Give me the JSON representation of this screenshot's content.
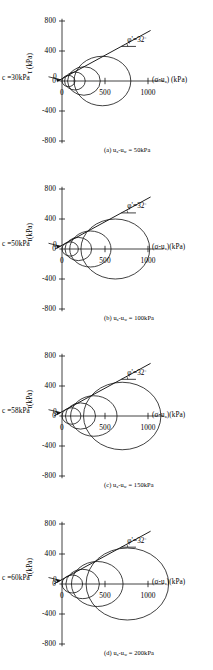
{
  "figure": {
    "type": "multi-panel-mohr-circle-figure",
    "panel_count": 4,
    "axis": {
      "y_label": "τ (kPa)",
      "y_label_b": "τ(kPa)",
      "y_ticks": [
        "800",
        "400",
        "0",
        "-400",
        "-800"
      ],
      "y_tick_values": [
        800,
        400,
        0,
        -400,
        -800
      ],
      "x_ticks": [
        "0",
        "500",
        "1000"
      ],
      "x_tick_values": [
        0,
        500,
        1000
      ],
      "x_label_spaced": "(σ-u",
      "x_label_sub": "a",
      "x_label_tail_spaced": ") (kPa)",
      "x_label_tail_tight": ")(kPa)",
      "origin_zero": "0"
    },
    "envelope": {
      "phi_symbol": "φ'=32",
      "phi_degree": "°",
      "phi_value": 32,
      "phi_label_full": "φ'=32°"
    }
  },
  "chart_data": {
    "type": "scatter",
    "xlabel": "(σ-u_a) (kPa)",
    "ylabel": "τ (kPa)",
    "xlim": [
      -60,
      1200
    ],
    "ylim": [
      -900,
      900
    ],
    "grid": false,
    "legend": "none",
    "shared": {
      "phi_deg": 32,
      "x_ticks": [
        0,
        500,
        1000
      ],
      "y_ticks": [
        800,
        400,
        0,
        -400,
        -800
      ]
    },
    "panels": [
      {
        "id": "a",
        "label": "(a) u",
        "label_sub1": "a",
        "label_mid": "-u",
        "label_sub2": "w",
        "label_tail": " = 50kPa",
        "caption": "(a) u_a-u_w = 50kPa",
        "matric_suction_kPa": 50,
        "cohesion_label_pre": "c =30kPa",
        "cohesion_kPa": 30,
        "phi_label": "φ'=32°",
        "envelope_intercept_kPa": 30,
        "envelope_slope_deg": 32,
        "circles": [
          {
            "center_kPa": 75,
            "radius_kPa": 75
          },
          {
            "center_kPa": 150,
            "radius_kPa": 120
          },
          {
            "center_kPa": 255,
            "radius_kPa": 190
          },
          {
            "center_kPa": 470,
            "radius_kPa": 330
          }
        ]
      },
      {
        "id": "b",
        "label": "(b) u",
        "label_sub1": "a",
        "label_mid": "-u",
        "label_sub2": "w",
        "label_tail": " = 100kPa",
        "caption": "(b) u_a-u_w = 100kPa",
        "matric_suction_kPa": 100,
        "cohesion_label_pre": "c =50kPa",
        "cohesion_kPa": 50,
        "phi_label": "φ'=32°",
        "envelope_intercept_kPa": 50,
        "envelope_slope_deg": 32,
        "circles": [
          {
            "center_kPa": 95,
            "radius_kPa": 95
          },
          {
            "center_kPa": 190,
            "radius_kPa": 155
          },
          {
            "center_kPa": 330,
            "radius_kPa": 240
          },
          {
            "center_kPa": 620,
            "radius_kPa": 400
          }
        ]
      },
      {
        "id": "c",
        "label": "(c) u",
        "label_sub1": "a",
        "label_mid": "-u",
        "label_sub2": "w",
        "label_tail": " = 150kPa",
        "caption": "(c) u_a-u_w = 150kPa",
        "matric_suction_kPa": 150,
        "cohesion_label_pre": "c =58kPa",
        "cohesion_kPa": 58,
        "phi_label": "φ'=32°",
        "envelope_intercept_kPa": 58,
        "envelope_slope_deg": 32,
        "circles": [
          {
            "center_kPa": 110,
            "radius_kPa": 110
          },
          {
            "center_kPa": 215,
            "radius_kPa": 175
          },
          {
            "center_kPa": 370,
            "radius_kPa": 270
          },
          {
            "center_kPa": 700,
            "radius_kPa": 450
          }
        ]
      },
      {
        "id": "d",
        "label": "(d) u",
        "label_sub1": "a",
        "label_mid": "-u",
        "label_sub2": "w",
        "label_tail": " = 200kPa",
        "caption": "(d) u_a-u_w = 200kPa",
        "matric_suction_kPa": 200,
        "cohesion_label_pre": "c =60kPa",
        "cohesion_kPa": 60,
        "phi_label": "φ'=32°",
        "envelope_intercept_kPa": 60,
        "envelope_slope_deg": 32,
        "circles": [
          {
            "center_kPa": 120,
            "radius_kPa": 120
          },
          {
            "center_kPa": 240,
            "radius_kPa": 195
          },
          {
            "center_kPa": 410,
            "radius_kPa": 300
          },
          {
            "center_kPa": 760,
            "radius_kPa": 480
          }
        ]
      }
    ]
  }
}
